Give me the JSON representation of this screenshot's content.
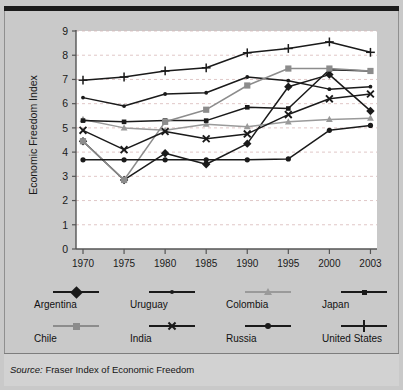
{
  "source_note": {
    "prefix": "Source:",
    "text": " Fraser Index of Economic Freedom"
  },
  "axes": {
    "ylabel": "Economic Freedom Index",
    "yticks": [
      "0",
      "1",
      "2",
      "3",
      "4",
      "5",
      "6",
      "7",
      "8",
      "9"
    ],
    "xticks": [
      "1970",
      "1975",
      "1980",
      "1985",
      "1990",
      "1995",
      "2000",
      "2003"
    ]
  },
  "legend": {
    "items": [
      {
        "label": "Argentina",
        "marker": "diamond",
        "color": "#1a1a1a"
      },
      {
        "label": "Uruguay",
        "marker": "small-dot",
        "color": "#1a1a1a"
      },
      {
        "label": "Colombia",
        "marker": "triangle",
        "color": "#9a9a9a"
      },
      {
        "label": "Japan",
        "marker": "small-square",
        "color": "#1a1a1a"
      },
      {
        "label": "Chile",
        "marker": "square",
        "color": "#8c8c8c"
      },
      {
        "label": "India",
        "marker": "cross-x",
        "color": "#1a1a1a"
      },
      {
        "label": "Russia",
        "marker": "circle",
        "color": "#1a1a1a"
      },
      {
        "label": "United States",
        "marker": "plus",
        "color": "#1a1a1a"
      }
    ]
  },
  "chart_data": {
    "type": "line",
    "title": "",
    "xlabel": "",
    "ylabel": "Economic Freedom Index",
    "categories": [
      "1970",
      "1975",
      "1980",
      "1985",
      "1990",
      "1995",
      "2000",
      "2003"
    ],
    "ylim": [
      0,
      9
    ],
    "xlim": [
      0,
      7
    ],
    "grid": "horizontal-dashed",
    "legend_position": "below-plot",
    "series": [
      {
        "name": "Argentina",
        "marker": "diamond",
        "color": "#1a1a1a",
        "values": [
          4.45,
          2.85,
          3.95,
          3.5,
          4.35,
          6.7,
          7.2,
          5.7
        ]
      },
      {
        "name": "Uruguay",
        "marker": "small-dot",
        "color": "#1a1a1a",
        "values": [
          6.25,
          5.9,
          6.4,
          6.45,
          7.1,
          6.95,
          6.6,
          6.7
        ]
      },
      {
        "name": "Colombia",
        "marker": "triangle",
        "color": "#9a9a9a",
        "values": [
          5.35,
          5.0,
          4.9,
          5.15,
          5.05,
          5.25,
          5.35,
          5.4
        ]
      },
      {
        "name": "Japan",
        "marker": "small-square",
        "color": "#1a1a1a",
        "values": [
          5.3,
          5.25,
          5.3,
          5.3,
          5.85,
          5.8,
          7.4,
          7.35
        ]
      },
      {
        "name": "Chile",
        "marker": "square",
        "color": "#8c8c8c",
        "values": [
          4.45,
          2.85,
          5.25,
          5.75,
          6.75,
          7.45,
          7.45,
          7.35
        ]
      },
      {
        "name": "India",
        "marker": "cross-x",
        "color": "#1a1a1a",
        "values": [
          4.9,
          4.1,
          4.85,
          4.55,
          4.75,
          5.55,
          6.2,
          6.4
        ]
      },
      {
        "name": "Russia",
        "marker": "circle",
        "color": "#1a1a1a",
        "values": [
          3.68,
          3.68,
          3.68,
          3.68,
          3.68,
          3.72,
          4.9,
          5.1
        ]
      },
      {
        "name": "United States",
        "marker": "plus",
        "color": "#1a1a1a",
        "values": [
          6.97,
          7.1,
          7.35,
          7.48,
          8.1,
          8.28,
          8.55,
          8.12
        ]
      }
    ]
  }
}
